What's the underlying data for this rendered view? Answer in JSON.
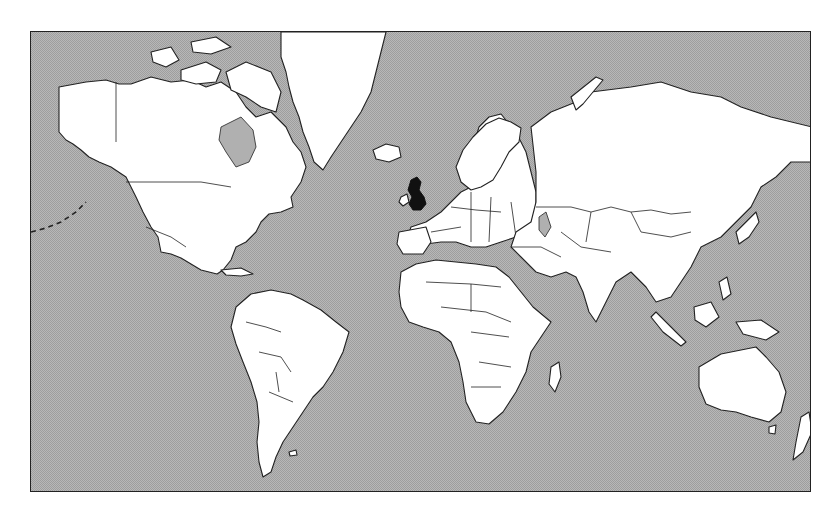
{
  "map": {
    "type": "world political outline map",
    "projection": "Mercator",
    "highlighted_region": "United Kingdom",
    "colors": {
      "ocean": "#b8b8b8",
      "land": "#ffffff",
      "highlight": "#111111",
      "outline": "#222222"
    },
    "regions": [
      {
        "name": "North America"
      },
      {
        "name": "Greenland"
      },
      {
        "name": "South America"
      },
      {
        "name": "Europe"
      },
      {
        "name": "Africa"
      },
      {
        "name": "Asia"
      },
      {
        "name": "Australia"
      },
      {
        "name": "New Zealand"
      },
      {
        "name": "United Kingdom",
        "highlighted": true
      }
    ]
  }
}
